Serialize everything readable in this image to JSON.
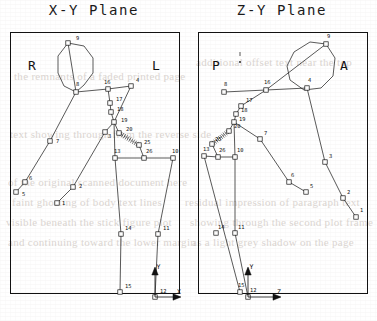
{
  "figure": {
    "background_color": "#ffffff",
    "ink_color": "#111111",
    "node_marker": "open-square",
    "panel_count": 2
  },
  "bleed_text": [
    {
      "text": "the  remnants  of  a  faded  printed  page",
      "x": 14,
      "y": 70
    },
    {
      "text": "text showing through from the reverse side",
      "x": 10,
      "y": 128
    },
    {
      "text": "of  the  original  scanned  document  here",
      "x": 8,
      "y": 176
    },
    {
      "text": "faint  ghosting  of  body  text  lines",
      "x": 12,
      "y": 196
    },
    {
      "text": "visible  beneath  the  stick  figure  plot",
      "x": 6,
      "y": 216
    },
    {
      "text": "and  continuing  toward  the  lower  margin",
      "x": 8,
      "y": 236
    },
    {
      "text": "residual  impression  of  paragraph  text",
      "x": 185,
      "y": 196
    },
    {
      "text": "showing  through  the  second  plot  frame",
      "x": 190,
      "y": 216
    },
    {
      "text": "as  a  light  grey  shadow  on  the  page",
      "x": 192,
      "y": 236
    },
    {
      "text": "additional  offset  text  near  the  top",
      "x": 196,
      "y": 56
    }
  ],
  "panels": [
    {
      "id": "xy",
      "title": "X-Y Plane",
      "frame": {
        "x": 10,
        "y": 32,
        "width": 170,
        "height": 262
      },
      "side_labels": [
        {
          "name": "right-side-label",
          "text": "R",
          "x": 28,
          "y": 58
        },
        {
          "name": "left-side-label",
          "text": "L",
          "x": 152,
          "y": 58
        }
      ],
      "axes": {
        "origin": {
          "x": 155,
          "y": 297
        },
        "vertical": {
          "label": "Y",
          "tip": {
            "x": 155,
            "y": 268
          }
        },
        "horizontal": {
          "label": "X",
          "tip": {
            "x": 180,
            "y": 297
          }
        }
      },
      "nodes": [
        {
          "id": 1,
          "x": 57,
          "y": 203,
          "lx": 62,
          "ly": 205
        },
        {
          "id": 2,
          "x": 73,
          "y": 187,
          "lx": 79,
          "ly": 188
        },
        {
          "id": 5,
          "x": 16,
          "y": 192,
          "lx": 22,
          "ly": 196
        },
        {
          "id": 6,
          "x": 25,
          "y": 182,
          "lx": 29,
          "ly": 180
        },
        {
          "id": 7,
          "x": 50,
          "y": 141,
          "lx": 56,
          "ly": 143
        },
        {
          "id": 8,
          "x": 76,
          "y": 92,
          "lx": 76,
          "ly": 86
        },
        {
          "id": 9,
          "x": 68,
          "y": 43,
          "lx": 76,
          "ly": 40
        },
        {
          "id": 16,
          "x": 108,
          "y": 89,
          "lx": 104,
          "ly": 84
        },
        {
          "id": 4,
          "x": 131,
          "y": 86,
          "lx": 136,
          "ly": 82
        },
        {
          "id": 17,
          "x": 110,
          "y": 103,
          "lx": 116,
          "ly": 101
        },
        {
          "id": 18,
          "x": 111,
          "y": 112,
          "lx": 117,
          "ly": 111
        },
        {
          "id": 19,
          "x": 114,
          "y": 122,
          "lx": 121,
          "ly": 122
        },
        {
          "id": 20,
          "x": 119,
          "y": 133,
          "lx": 126,
          "ly": 131
        },
        {
          "id": 3,
          "x": 105,
          "y": 132,
          "lx": 108,
          "ly": 138
        },
        {
          "id": 25,
          "x": 139,
          "y": 145,
          "lx": 144,
          "ly": 144
        },
        {
          "id": 13,
          "x": 115,
          "y": 158,
          "lx": 114,
          "ly": 153
        },
        {
          "id": 26,
          "x": 144,
          "y": 158,
          "lx": 146,
          "ly": 153
        },
        {
          "id": 10,
          "x": 173,
          "y": 158,
          "lx": 172,
          "ly": 153
        },
        {
          "id": 14,
          "x": 121,
          "y": 234,
          "lx": 125,
          "ly": 230
        },
        {
          "id": 11,
          "x": 158,
          "y": 234,
          "lx": 163,
          "ly": 230
        },
        {
          "id": 15,
          "x": 120,
          "y": 292,
          "lx": 125,
          "ly": 288
        },
        {
          "id": 12,
          "x": 155,
          "y": 297,
          "lx": 160,
          "ly": 293
        }
      ],
      "head_polygon": [
        {
          "x": 68,
          "y": 43
        },
        {
          "x": 84,
          "y": 46
        },
        {
          "x": 93,
          "y": 58
        },
        {
          "x": 93,
          "y": 73
        },
        {
          "x": 84,
          "y": 85
        },
        {
          "x": 76,
          "y": 92
        },
        {
          "x": 64,
          "y": 86
        },
        {
          "x": 58,
          "y": 73
        },
        {
          "x": 58,
          "y": 56
        }
      ],
      "segments": [
        {
          "from": 9,
          "to": 8,
          "style": "solid"
        },
        {
          "from": 8,
          "to": 16,
          "style": "solid"
        },
        {
          "from": 16,
          "to": 4,
          "style": "solid"
        },
        {
          "from": 16,
          "to": 76,
          "style": "none"
        },
        {
          "from": 8,
          "to": 7,
          "style": "solid"
        },
        {
          "from": 7,
          "to": 6,
          "style": "solid"
        },
        {
          "from": 6,
          "to": 5,
          "style": "solid"
        },
        {
          "from": 4,
          "to": 19,
          "style": "solid"
        },
        {
          "from": 16,
          "to": 17,
          "style": "solid"
        },
        {
          "from": 17,
          "to": 18,
          "style": "solid"
        },
        {
          "from": 18,
          "to": 19,
          "style": "solid"
        },
        {
          "from": 19,
          "to": 20,
          "style": "solid"
        },
        {
          "from": 19,
          "to": 3,
          "style": "solid"
        },
        {
          "from": 3,
          "to": 2,
          "style": "solid"
        },
        {
          "from": 2,
          "to": 1,
          "style": "solid"
        },
        {
          "from": 20,
          "to": 25,
          "style": "dotted-ladder"
        },
        {
          "from": 25,
          "to": 26,
          "style": "solid"
        },
        {
          "from": 13,
          "to": 26,
          "style": "solid"
        },
        {
          "from": 26,
          "to": 10,
          "style": "solid"
        },
        {
          "from": 13,
          "to": 14,
          "style": "solid"
        },
        {
          "from": 14,
          "to": 15,
          "style": "solid"
        },
        {
          "from": 10,
          "to": 11,
          "style": "solid"
        },
        {
          "from": 11,
          "to": 12,
          "style": "solid"
        },
        {
          "from": 19,
          "to": 13,
          "style": "solid"
        }
      ]
    },
    {
      "id": "zy",
      "title": "Z-Y Plane",
      "frame": {
        "x": 10,
        "y": 32,
        "width": 170,
        "height": 262
      },
      "side_labels": [
        {
          "name": "posterior-side-label",
          "text": "P",
          "x": 24,
          "y": 58
        },
        {
          "name": "anterior-side-label",
          "text": "A",
          "x": 152,
          "y": 58
        }
      ],
      "axes": {
        "origin": {
          "x": 60,
          "y": 297
        },
        "vertical": {
          "label": "Y",
          "tip": {
            "x": 60,
            "y": 268
          }
        },
        "horizontal": {
          "label": "Z",
          "tip": {
            "x": 92,
            "y": 297
          }
        }
      },
      "nodes": [
        {
          "id": 1,
          "x": 168,
          "y": 217,
          "lx": 172,
          "ly": 212
        },
        {
          "id": 2,
          "x": 155,
          "y": 198,
          "lx": 159,
          "ly": 194
        },
        {
          "id": 3,
          "x": 137,
          "y": 162,
          "lx": 141,
          "ly": 158
        },
        {
          "id": 5,
          "x": 118,
          "y": 192,
          "lx": 122,
          "ly": 188
        },
        {
          "id": 6,
          "x": 101,
          "y": 182,
          "lx": 103,
          "ly": 177
        },
        {
          "id": 7,
          "x": 72,
          "y": 139,
          "lx": 76,
          "ly": 135
        },
        {
          "id": 8,
          "x": 36,
          "y": 92,
          "lx": 36,
          "ly": 86
        },
        {
          "id": 9,
          "x": 138,
          "y": 44,
          "lx": 139,
          "ly": 38
        },
        {
          "id": 4,
          "x": 119,
          "y": 88,
          "lx": 120,
          "ly": 82
        },
        {
          "id": 16,
          "x": 78,
          "y": 90,
          "lx": 76,
          "ly": 84
        },
        {
          "id": 17,
          "x": 53,
          "y": 106,
          "lx": 58,
          "ly": 102
        },
        {
          "id": 18,
          "x": 48,
          "y": 114,
          "lx": 53,
          "ly": 112
        },
        {
          "id": 19,
          "x": 46,
          "y": 122,
          "lx": 51,
          "ly": 121
        },
        {
          "id": 20,
          "x": 41,
          "y": 131,
          "lx": 46,
          "ly": 128
        },
        {
          "id": 25,
          "x": 24,
          "y": 144,
          "lx": 27,
          "ly": 141
        },
        {
          "id": 13,
          "x": 16,
          "y": 156,
          "lx": 15,
          "ly": 151
        },
        {
          "id": 26,
          "x": 30,
          "y": 157,
          "lx": 31,
          "ly": 152
        },
        {
          "id": 10,
          "x": 47,
          "y": 157,
          "lx": 49,
          "ly": 152
        },
        {
          "id": 14,
          "x": 28,
          "y": 233,
          "lx": 30,
          "ly": 229
        },
        {
          "id": 11,
          "x": 47,
          "y": 233,
          "lx": 50,
          "ly": 229
        },
        {
          "id": 15,
          "x": 52,
          "y": 292,
          "lx": 50,
          "ly": 287
        },
        {
          "id": 12,
          "x": 60,
          "y": 297,
          "lx": 62,
          "ly": 292
        }
      ],
      "head_polygon": [
        {
          "x": 138,
          "y": 44
        },
        {
          "x": 122,
          "y": 42
        },
        {
          "x": 106,
          "y": 52
        },
        {
          "x": 99,
          "y": 66
        },
        {
          "x": 102,
          "y": 80
        },
        {
          "x": 116,
          "y": 90
        },
        {
          "x": 133,
          "y": 88
        },
        {
          "x": 145,
          "y": 76
        },
        {
          "x": 147,
          "y": 58
        }
      ],
      "stray_marks": [
        {
          "x": 52,
          "y": 54,
          "type": "tick"
        },
        {
          "x": 52,
          "y": 62,
          "type": "dot"
        }
      ],
      "segments": [
        {
          "from": 9,
          "to": 16,
          "style": "solid"
        },
        {
          "from": 8,
          "to": 16,
          "style": "solid"
        },
        {
          "from": 16,
          "to": 4,
          "style": "solid"
        },
        {
          "from": 4,
          "to": 3,
          "style": "solid"
        },
        {
          "from": 3,
          "to": 2,
          "style": "solid"
        },
        {
          "from": 2,
          "to": 1,
          "style": "solid"
        },
        {
          "from": 16,
          "to": 17,
          "style": "solid"
        },
        {
          "from": 17,
          "to": 18,
          "style": "solid"
        },
        {
          "from": 18,
          "to": 19,
          "style": "solid"
        },
        {
          "from": 19,
          "to": 20,
          "style": "solid"
        },
        {
          "from": 19,
          "to": 7,
          "style": "solid"
        },
        {
          "from": 7,
          "to": 6,
          "style": "solid"
        },
        {
          "from": 6,
          "to": 5,
          "style": "solid"
        },
        {
          "from": 20,
          "to": 25,
          "style": "dotted-ladder"
        },
        {
          "from": 25,
          "to": 26,
          "style": "solid"
        },
        {
          "from": 13,
          "to": 26,
          "style": "solid"
        },
        {
          "from": 26,
          "to": 10,
          "style": "solid"
        },
        {
          "from": 13,
          "to": 15,
          "style": "solid"
        },
        {
          "from": 10,
          "to": 11,
          "style": "solid"
        },
        {
          "from": 11,
          "to": 12,
          "style": "solid"
        },
        {
          "from": 19,
          "to": 10,
          "style": "solid"
        }
      ]
    }
  ]
}
